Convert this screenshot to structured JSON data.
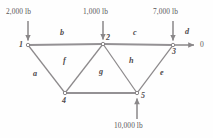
{
  "figure": {
    "type": "truss-free-body-diagram",
    "line_color": "#8a8789",
    "member_line_color": "#9a9799",
    "text_color": "#555153",
    "background": "#fefefe"
  },
  "joints": [
    {
      "id": "1",
      "label": "1",
      "x": 28,
      "y": 45
    },
    {
      "id": "2",
      "label": "2",
      "x": 103,
      "y": 44
    },
    {
      "id": "3",
      "label": "3",
      "x": 173,
      "y": 45
    },
    {
      "id": "4",
      "label": "4",
      "x": 65,
      "y": 93
    },
    {
      "id": "5",
      "label": "5",
      "x": 137,
      "y": 93
    }
  ],
  "members": [
    {
      "label": "a",
      "from": "1",
      "to": "4",
      "lx": 33,
      "ly": 70
    },
    {
      "label": "b",
      "from": "1",
      "to": "2",
      "lx": 60,
      "ly": 29
    },
    {
      "label": "c",
      "from": "2",
      "to": "3",
      "lx": 133,
      "ly": 29
    },
    {
      "label": "d",
      "from": "3",
      "to": "3",
      "lx": 185,
      "ly": 28
    },
    {
      "label": "e",
      "from": "5",
      "to": "3",
      "lx": 160,
      "ly": 69
    },
    {
      "label": "f",
      "from": "4",
      "to": "2",
      "lx": 63,
      "ly": 57
    },
    {
      "label": "g",
      "from": "4",
      "to": "5",
      "lx": 99,
      "ly": 68
    },
    {
      "label": "h",
      "from": "2",
      "to": "5",
      "lx": 129,
      "ly": 57
    }
  ],
  "loads": [
    {
      "id": "load-joint-1",
      "text": "2,000 lb",
      "joint": "1",
      "lx": 6,
      "ly": 8,
      "direction": "down"
    },
    {
      "id": "load-joint-2",
      "text": "1,000 lb",
      "joint": "2",
      "lx": 83,
      "ly": 8,
      "direction": "down"
    },
    {
      "id": "load-joint-3",
      "text": "7,000 lb",
      "joint": "3",
      "lx": 153,
      "ly": 8,
      "direction": "down"
    },
    {
      "id": "load-joint-5",
      "text": "10,000 lb",
      "joint": "5",
      "lx": 114,
      "ly": 122,
      "direction": "up"
    }
  ],
  "reactions": [
    {
      "id": "reaction-joint-3",
      "text": "0",
      "joint": "3",
      "lx": 200,
      "ly": 41,
      "direction": "right"
    }
  ]
}
